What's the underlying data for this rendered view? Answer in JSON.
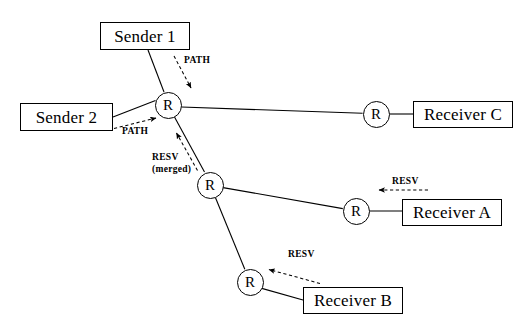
{
  "diagram": {
    "canvas": {
      "width": 529,
      "height": 326,
      "background": "#ffffff"
    },
    "colors": {
      "stroke": "#000000",
      "fill": "#ffffff",
      "text": "#000000"
    },
    "endpoints": [
      {
        "id": "sender1",
        "label": "Sender 1",
        "role": "sender",
        "x": 100,
        "y": 22,
        "w": 90,
        "h": 28
      },
      {
        "id": "sender2",
        "label": "Sender 2",
        "role": "sender",
        "x": 20,
        "y": 103,
        "w": 93,
        "h": 28
      },
      {
        "id": "receiverC",
        "label": "Receiver C",
        "role": "receiver",
        "x": 413,
        "y": 101,
        "w": 100,
        "h": 27
      },
      {
        "id": "receiverA",
        "label": "Receiver A",
        "role": "receiver",
        "x": 402,
        "y": 199,
        "w": 100,
        "h": 27
      },
      {
        "id": "receiverB",
        "label": "Receiver B",
        "role": "receiver",
        "x": 303,
        "y": 287,
        "w": 100,
        "h": 27
      }
    ],
    "routers": [
      {
        "id": "r-top",
        "label": "R",
        "cx": 168,
        "cy": 105,
        "r": 13.5
      },
      {
        "id": "r-mid",
        "label": "R",
        "cx": 210,
        "cy": 185,
        "r": 13.5
      },
      {
        "id": "r-bottom",
        "label": "R",
        "cx": 250,
        "cy": 282,
        "r": 13.5
      },
      {
        "id": "r-receiver-c",
        "label": "R",
        "cx": 376,
        "cy": 114,
        "r": 13.5
      },
      {
        "id": "r-receiver-a",
        "label": "R",
        "cx": 356,
        "cy": 211,
        "r": 13.5
      }
    ],
    "links": [
      {
        "id": "link-sender1-rtop",
        "from": "sender1",
        "to": "r-top",
        "x1": 148,
        "y1": 50,
        "x2": 164,
        "y2": 92
      },
      {
        "id": "link-sender2-rtop",
        "from": "sender2",
        "to": "r-top",
        "x1": 113,
        "y1": 117,
        "x2": 155,
        "y2": 100
      },
      {
        "id": "link-rtop-rc",
        "from": "r-top",
        "to": "r-receiver-c",
        "x1": 181,
        "y1": 107,
        "x2": 363,
        "y2": 114
      },
      {
        "id": "link-rc-receiverc",
        "from": "r-receiver-c",
        "to": "receiverC",
        "x1": 389,
        "y1": 114,
        "x2": 413,
        "y2": 114
      },
      {
        "id": "link-rtop-rmid",
        "from": "r-top",
        "to": "r-mid",
        "x1": 175,
        "y1": 117,
        "x2": 205,
        "y2": 172
      },
      {
        "id": "link-rmid-ra",
        "from": "r-mid",
        "to": "r-receiver-a",
        "x1": 223,
        "y1": 188,
        "x2": 343,
        "y2": 209
      },
      {
        "id": "link-ra-receivera",
        "from": "r-receiver-a",
        "to": "receiverA",
        "x1": 369,
        "y1": 211,
        "x2": 402,
        "y2": 211
      },
      {
        "id": "link-rmid-rbottom",
        "from": "r-mid",
        "to": "r-bottom",
        "x1": 216,
        "y1": 198,
        "x2": 245,
        "y2": 270
      },
      {
        "id": "link-rbottom-receiverb",
        "from": "r-bottom",
        "to": "receiverB",
        "x1": 262,
        "y1": 288,
        "x2": 303,
        "y2": 300
      }
    ],
    "messages": [
      {
        "id": "path-sender1",
        "label": "PATH",
        "type": "PATH",
        "direction": "sender-to-router",
        "label_x": 184,
        "label_y": 60,
        "arrow": {
          "x1": 174,
          "y1": 56,
          "x2": 192,
          "y2": 89
        }
      },
      {
        "id": "path-sender2",
        "label": "PATH",
        "type": "PATH",
        "direction": "sender-to-router",
        "label_x": 122,
        "label_y": 130,
        "arrow": {
          "x1": 113,
          "y1": 128,
          "x2": 157,
          "y2": 117
        }
      },
      {
        "id": "resv-merged",
        "label": "RESV",
        "sublabel": "(merged)",
        "type": "RESV",
        "direction": "router-to-router",
        "label_x": 152,
        "label_y": 152,
        "arrow": {
          "x1": 197,
          "y1": 170,
          "x2": 176,
          "y2": 133
        }
      },
      {
        "id": "resv-receiver-a",
        "label": "RESV",
        "type": "RESV",
        "direction": "receiver-to-router",
        "label_x": 392,
        "label_y": 176,
        "arrow": {
          "x1": 428,
          "y1": 190,
          "x2": 378,
          "y2": 190
        }
      },
      {
        "id": "resv-receiver-b",
        "label": "RESV",
        "type": "RESV",
        "direction": "receiver-to-router",
        "label_x": 288,
        "label_y": 250,
        "arrow": {
          "x1": 320,
          "y1": 283,
          "x2": 268,
          "y2": 269
        }
      }
    ]
  }
}
